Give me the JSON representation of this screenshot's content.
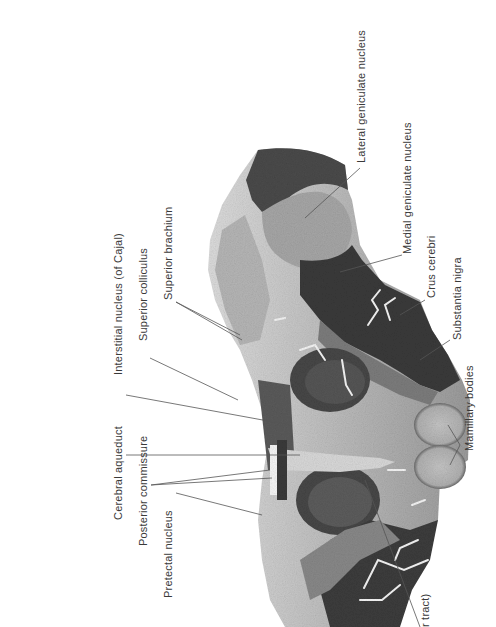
{
  "figure": {
    "background_color": "#ffffff",
    "tissue_colors": {
      "light_matter": "#b9b9b9",
      "mid_matter": "#8a8a8a",
      "dark_matter": "#4a4a4a",
      "darkest": "#2e2e2e",
      "vessel": "#f2f2f2"
    }
  },
  "labels": {
    "pretectal_nucleus": "Pretectal nucleus",
    "posterior_commissure": "Posterior commissure",
    "cerebral_aqueduct": "Cerebral aqueduct",
    "interstitial_nucleus": "Interstitial nucleus (of Cajal)",
    "superior_colliculus": "Superior colliculus",
    "superior_brachium": "Superior brachium",
    "lateral_geniculate_nucleus": "Lateral geniculate nucleus",
    "medial_geniculate_nucleus": "Medial geniculate nucleus",
    "crus_cerebri": "Crus cerebri",
    "substantia_nigra": "Substantia nigra",
    "mamillary_bodies": "Mamillary bodies",
    "truncated_tract": "r tract)"
  }
}
